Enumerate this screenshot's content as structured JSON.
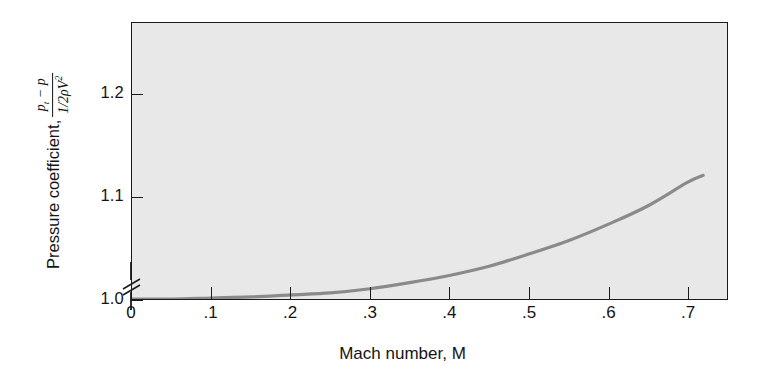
{
  "figure": {
    "background_color": "#ffffff",
    "plot_fill_color": "#e8e8e8",
    "axis_color": "#1a1a1a",
    "curve_color": "#8a8a8a"
  },
  "axes": {
    "x": {
      "title": "Mach number, M",
      "tick_labels": [
        "0",
        ".1",
        ".2",
        ".3",
        ".4",
        ".5",
        ".6",
        ".7"
      ],
      "tick_values": [
        0,
        0.1,
        0.2,
        0.3,
        0.4,
        0.5,
        0.6,
        0.7
      ],
      "range": [
        0,
        0.75
      ]
    },
    "y": {
      "title_prefix": "Pressure coefficient,",
      "numerator_p": "p",
      "numerator_sub": "t",
      "numerator_minus": "− p",
      "denominator_half": "1/2",
      "denominator_rho": "ρV",
      "denominator_exp": "2",
      "tick_labels": [
        "1.0",
        "1.1",
        "1.2"
      ],
      "tick_values": [
        1.0,
        1.1,
        1.2
      ],
      "range": [
        1.0,
        1.27
      ],
      "axis_break": true,
      "axis_break_name": "axis-break-symbol"
    }
  },
  "chart_data": {
    "type": "line",
    "title": "",
    "xlabel": "Mach number, M",
    "ylabel": "Pressure coefficient, (p_t − p)/(½ρV²)",
    "xlim": [
      0,
      0.75
    ],
    "ylim": [
      1.0,
      1.27
    ],
    "grid": false,
    "legend": "none",
    "axis_break_y_below": 1.0,
    "series": [
      {
        "name": "Compressibility correction factor",
        "color": "#8a8a8a",
        "x": [
          0.0,
          0.05,
          0.1,
          0.15,
          0.2,
          0.25,
          0.3,
          0.35,
          0.4,
          0.45,
          0.5,
          0.55,
          0.6,
          0.65,
          0.7,
          0.72
        ],
        "y": [
          1.0,
          1.0,
          1.001,
          1.002,
          1.004,
          1.006,
          1.01,
          1.016,
          1.023,
          1.032,
          1.044,
          1.057,
          1.073,
          1.091,
          1.114,
          1.121
        ]
      }
    ]
  }
}
